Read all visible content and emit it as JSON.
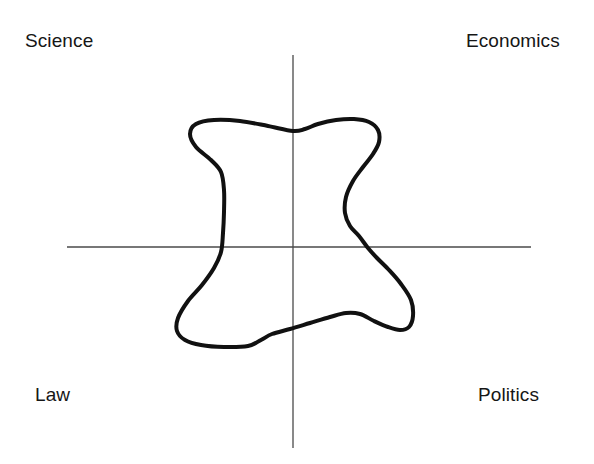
{
  "figure": {
    "width": 594,
    "height": 464,
    "background_color": "#ffffff",
    "axis_color": "#4a4a4a",
    "curve_color": "#111111",
    "label_color": "#161616"
  },
  "labels": {
    "top_left": "Science",
    "top_right": "Economics",
    "bottom_left": "Law",
    "bottom_right": "Politics"
  },
  "chart_data": {
    "type": "scatter",
    "title": "",
    "subtitle": "",
    "xlabel": "",
    "ylabel": "",
    "grid": false,
    "legend_position": "none",
    "axes": {
      "origin": [
        293,
        247
      ],
      "horizontal_line": [
        67,
        247,
        531,
        247
      ],
      "vertical_line": [
        293,
        55,
        293,
        448
      ],
      "xlim": [
        67,
        531
      ],
      "ylim": [
        55,
        448
      ],
      "tick_labels_x": [],
      "tick_labels_y": []
    },
    "quadrant_labels": [
      {
        "name": "Science",
        "quadrant": "top-left",
        "x": 25,
        "y": 40
      },
      {
        "name": "Economics",
        "quadrant": "top-right",
        "x": 466,
        "y": 40
      },
      {
        "name": "Law",
        "quadrant": "bottom-left",
        "x": 35,
        "y": 394
      },
      {
        "name": "Politics",
        "quadrant": "bottom-right",
        "x": 478,
        "y": 394
      }
    ],
    "series": [
      {
        "name": "boundary-contour",
        "closed": true,
        "stroke_width": 4,
        "points": [
          [
            293,
            131
          ],
          [
            268,
            126
          ],
          [
            240,
            121
          ],
          [
            214,
            120
          ],
          [
            196,
            124
          ],
          [
            190,
            134
          ],
          [
            196,
            147
          ],
          [
            211,
            160
          ],
          [
            221,
            172
          ],
          [
            224,
            190
          ],
          [
            224,
            212
          ],
          [
            223,
            233
          ],
          [
            221,
            252
          ],
          [
            214,
            268
          ],
          [
            202,
            285
          ],
          [
            188,
            301
          ],
          [
            178,
            318
          ],
          [
            177,
            331
          ],
          [
            185,
            340
          ],
          [
            201,
            345
          ],
          [
            224,
            347
          ],
          [
            248,
            346
          ],
          [
            261,
            340
          ],
          [
            272,
            334
          ],
          [
            290,
            329
          ],
          [
            310,
            323
          ],
          [
            330,
            317
          ],
          [
            346,
            313
          ],
          [
            360,
            314
          ],
          [
            374,
            321
          ],
          [
            388,
            327
          ],
          [
            400,
            330
          ],
          [
            409,
            327
          ],
          [
            413,
            316
          ],
          [
            411,
            300
          ],
          [
            401,
            284
          ],
          [
            389,
            270
          ],
          [
            377,
            258
          ],
          [
            368,
            248
          ],
          [
            359,
            236
          ],
          [
            350,
            226
          ],
          [
            345,
            213
          ],
          [
            346,
            197
          ],
          [
            353,
            181
          ],
          [
            363,
            167
          ],
          [
            373,
            154
          ],
          [
            379,
            142
          ],
          [
            378,
            130
          ],
          [
            369,
            122
          ],
          [
            354,
            119
          ],
          [
            336,
            120
          ],
          [
            318,
            124
          ],
          [
            305,
            129
          ],
          [
            293,
            131
          ]
        ]
      }
    ]
  }
}
